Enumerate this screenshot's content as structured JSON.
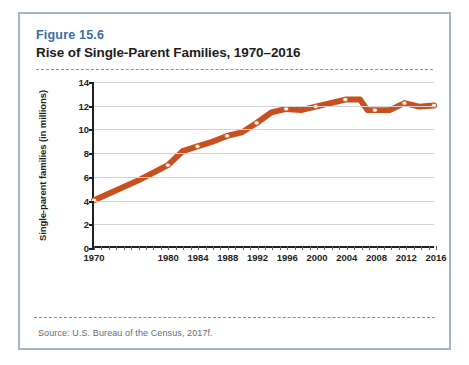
{
  "figure": {
    "label": "Figure 15.6",
    "title": "Rise of Single-Parent Families, 1970–2016",
    "source": "Source: U.S. Bureau of the Census, 2017f.",
    "border_color": "#a8b4ca",
    "label_color": "#3a6ea8",
    "title_color": "#1d1d1f"
  },
  "chart_data": {
    "type": "line",
    "title": "Rise of Single-Parent Families, 1970–2016",
    "xlabel": "",
    "ylabel": "Single-parent families (in millions)",
    "xlim": [
      1970,
      2016
    ],
    "ylim": [
      0,
      14
    ],
    "ytick_labels": [
      "0",
      "2",
      "4",
      "6",
      "8",
      "10",
      "12",
      "14"
    ],
    "yticks": [
      0,
      2,
      4,
      6,
      8,
      10,
      12,
      14
    ],
    "xtick_labels": [
      "1970",
      "1980",
      "1984",
      "1988",
      "1992",
      "1996",
      "2000",
      "2004",
      "2008",
      "2012",
      "2016"
    ],
    "xticks": [
      1970,
      1980,
      1984,
      1988,
      1992,
      1996,
      2000,
      2004,
      2008,
      2012,
      2016
    ],
    "grid": "horizontal",
    "legend": "none",
    "line_color": "#c8501e",
    "marker_color": "#fdf3e6",
    "marker_shape": "circle",
    "x": [
      1970,
      1980,
      1984,
      1988,
      1992,
      1996,
      2000,
      2004,
      2008,
      2012,
      2016
    ],
    "values": [
      3.9,
      6.9,
      8.5,
      9.4,
      10.5,
      11.7,
      11.9,
      12.5,
      11.6,
      12.2,
      12.0
    ],
    "series": [
      {
        "name": "Single-parent families",
        "values": [
          3.9,
          6.9,
          8.5,
          9.4,
          10.5,
          11.7,
          11.9,
          12.5,
          11.6,
          12.2,
          12.0
        ]
      }
    ],
    "path_points": [
      {
        "x": 1970,
        "y": 3.9
      },
      {
        "x": 1976,
        "y": 5.6
      },
      {
        "x": 1980,
        "y": 6.9
      },
      {
        "x": 1982,
        "y": 8.1
      },
      {
        "x": 1984,
        "y": 8.5
      },
      {
        "x": 1986,
        "y": 8.9
      },
      {
        "x": 1988,
        "y": 9.4
      },
      {
        "x": 1990,
        "y": 9.7
      },
      {
        "x": 1992,
        "y": 10.5
      },
      {
        "x": 1994,
        "y": 11.4
      },
      {
        "x": 1996,
        "y": 11.7
      },
      {
        "x": 1998,
        "y": 11.6
      },
      {
        "x": 2000,
        "y": 11.9
      },
      {
        "x": 2002,
        "y": 12.2
      },
      {
        "x": 2004,
        "y": 12.5
      },
      {
        "x": 2006,
        "y": 12.5
      },
      {
        "x": 2007,
        "y": 11.6
      },
      {
        "x": 2008,
        "y": 11.6
      },
      {
        "x": 2010,
        "y": 11.6
      },
      {
        "x": 2012,
        "y": 12.2
      },
      {
        "x": 2014,
        "y": 11.9
      },
      {
        "x": 2016,
        "y": 12.0
      }
    ],
    "minor_tick_step": 1
  }
}
